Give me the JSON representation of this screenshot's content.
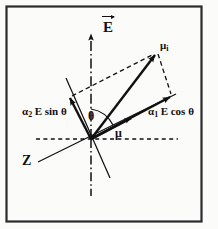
{
  "figure": {
    "type": "vector-diagram",
    "frame": {
      "border_color": "#2b2b2b",
      "background": "#fbfbfa",
      "x": 6,
      "y": 6,
      "width": 196,
      "height": 216
    },
    "ink_color": "#111111",
    "origin": {
      "x": 91,
      "y": 139
    },
    "labels": [
      {
        "name": "field-vector-E",
        "text": "E",
        "accent": "arrow-over",
        "x": 103,
        "y": 20
      },
      {
        "name": "induced-moment",
        "text": "μ",
        "subscript": "i",
        "x": 160,
        "y": 40
      },
      {
        "name": "perpendicular-component",
        "text": "α",
        "subscript": "2",
        "rest": "E sin θ",
        "x": 22,
        "y": 106
      },
      {
        "name": "parallel-component",
        "text": "α",
        "subscript": "1",
        "rest": "E cos θ",
        "x": 148,
        "y": 106
      },
      {
        "name": "angle-theta",
        "text": "θ",
        "x": 88,
        "y": 110
      },
      {
        "name": "permanent-moment",
        "text": "μ",
        "x": 115,
        "y": 127
      },
      {
        "name": "axis-z",
        "text": "Z",
        "x": 22,
        "y": 154
      }
    ],
    "axes": [
      {
        "name": "electric-field-axis",
        "style": "dash-dot",
        "description": "vertical field direction axis through origin",
        "x1": 91,
        "y1": 196,
        "x2": 91,
        "y2": 30,
        "arrow_at_end": true
      },
      {
        "name": "horizontal-reference-axis",
        "style": "dashed",
        "description": "horizontal reference line through origin",
        "x1": 36,
        "y1": 139,
        "x2": 178,
        "y2": 139,
        "arrow_at_end": false
      },
      {
        "name": "molecular-z-axis",
        "style": "solid",
        "description": "molecular long axis Z passing through origin",
        "x1": 40,
        "y1": 161,
        "x2": 172,
        "y2": 96
      },
      {
        "name": "perpendicular-molecular-axis",
        "style": "solid",
        "description": "axis perpendicular to Z through origin",
        "x1": 68,
        "y1": 82,
        "x2": 108,
        "y2": 174
      }
    ],
    "vectors": [
      {
        "name": "vector-mu-i",
        "label": "μ_i",
        "style": "solid",
        "x1": 91,
        "y1": 139,
        "x2": 157,
        "y2": 52,
        "description": "resultant induced dipole moment"
      },
      {
        "name": "vector-alpha1-E-cos-theta",
        "label": "α₁E cos θ",
        "style": "solid",
        "x1": 91,
        "y1": 139,
        "x2": 172,
        "y2": 96,
        "description": "component along molecular Z axis"
      },
      {
        "name": "vector-alpha2-E-sin-theta",
        "label": "α₂E sin θ",
        "style": "solid",
        "x1": 91,
        "y1": 139,
        "x2": 70,
        "y2": 97,
        "description": "component perpendicular to molecular Z axis"
      },
      {
        "name": "vector-mu",
        "label": "μ",
        "style": "solid",
        "x1": 91,
        "y1": 139,
        "x2": 133,
        "y2": 117,
        "description": "permanent dipole moment along molecular axis"
      }
    ],
    "construction_lines": [
      {
        "name": "parallelogram-side-upper-left",
        "style": "dashed",
        "x1": 70,
        "y1": 97,
        "x2": 157,
        "y2": 52
      },
      {
        "name": "parallelogram-side-lower-right",
        "style": "dashed",
        "x1": 157,
        "y1": 52,
        "x2": 172,
        "y2": 96
      }
    ],
    "angle_arc": {
      "name": "theta-arc",
      "description": "angle theta between field axis and induced moment",
      "cx": 91,
      "cy": 139,
      "radius": 30,
      "start_deg": 90,
      "end_deg": 53
    }
  }
}
